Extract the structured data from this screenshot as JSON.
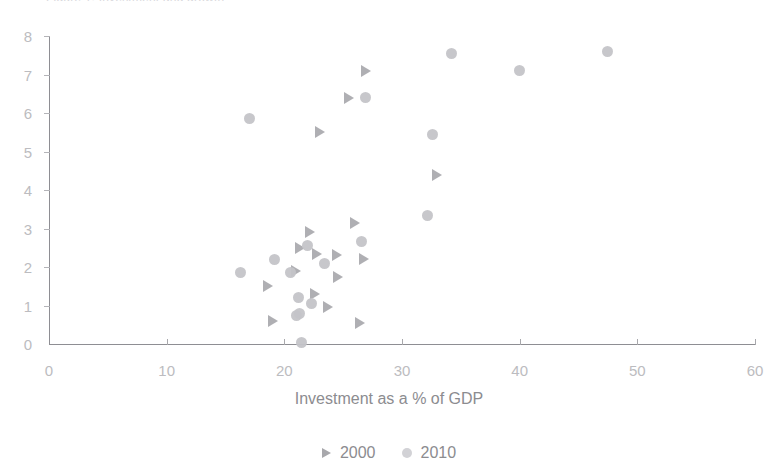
{
  "chart_data": {
    "type": "scatter",
    "title": "Figure 1: Investment and growth",
    "xlabel": "Investment as a % of GDP",
    "ylabel": "",
    "xlim": [
      0,
      60
    ],
    "ylim": [
      0,
      8
    ],
    "xticks": [
      0,
      10,
      20,
      30,
      40,
      50,
      60
    ],
    "yticks": [
      0,
      1,
      2,
      3,
      4,
      5,
      6,
      7,
      8
    ],
    "grid": false,
    "legend_position": "bottom-center",
    "series": [
      {
        "name": "2000",
        "marker": "triangle-right",
        "color": "#a8a8ac",
        "points": [
          [
            18.6,
            1.5
          ],
          [
            19.0,
            0.6
          ],
          [
            21.0,
            1.9
          ],
          [
            21.3,
            2.5
          ],
          [
            22.2,
            2.9
          ],
          [
            22.6,
            1.3
          ],
          [
            22.8,
            2.35
          ],
          [
            23.0,
            5.5
          ],
          [
            23.7,
            0.95
          ],
          [
            24.5,
            2.3
          ],
          [
            24.6,
            1.75
          ],
          [
            25.5,
            6.4
          ],
          [
            26.0,
            3.15
          ],
          [
            26.4,
            0.55
          ],
          [
            26.8,
            2.2
          ],
          [
            26.9,
            7.1
          ],
          [
            33.0,
            4.4
          ]
        ]
      },
      {
        "name": "2010",
        "marker": "circle",
        "color": "#c4c4c8",
        "points": [
          [
            16.3,
            1.85
          ],
          [
            17.0,
            5.85
          ],
          [
            19.2,
            2.2
          ],
          [
            20.5,
            1.85
          ],
          [
            21.0,
            0.75
          ],
          [
            21.2,
            1.2
          ],
          [
            21.3,
            0.8
          ],
          [
            21.5,
            0.05
          ],
          [
            22.0,
            2.55
          ],
          [
            22.3,
            1.05
          ],
          [
            23.4,
            2.1
          ],
          [
            26.6,
            2.65
          ],
          [
            26.9,
            6.4
          ],
          [
            32.2,
            3.35
          ],
          [
            32.6,
            5.45
          ],
          [
            34.2,
            7.55
          ],
          [
            40.0,
            7.1
          ],
          [
            47.5,
            7.6
          ]
        ]
      }
    ]
  },
  "legend": {
    "items": [
      {
        "label": "2000"
      },
      {
        "label": "2010"
      }
    ]
  }
}
